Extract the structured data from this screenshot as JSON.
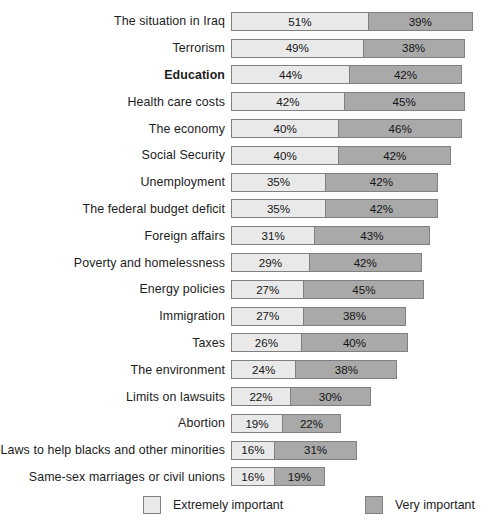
{
  "chart_data": {
    "type": "bar",
    "subtype": "stacked-horizontal",
    "title": "",
    "xlabel": "",
    "ylabel": "",
    "xlim": [
      0,
      90
    ],
    "grid": false,
    "legend_position": "bottom",
    "value_suffix": "%",
    "px_per_percent": 2.685,
    "categories": [
      "The situation in Iraq",
      "Terrorism",
      "Education",
      "Health care costs",
      "The economy",
      "Social Security",
      "Unemployment",
      "The federal budget deficit",
      "Foreign affairs",
      "Poverty and homelessness",
      "Energy policies",
      "Immigration",
      "Taxes",
      "The environment",
      "Limits on lawsuits",
      "Abortion",
      "Laws to help blacks and other minorities",
      "Same-sex marriages or civil unions"
    ],
    "highlight_category": "Education",
    "series": [
      {
        "name": "Extremely important",
        "color": "#e9e9e9",
        "values": [
          51,
          49,
          44,
          42,
          40,
          40,
          35,
          35,
          31,
          29,
          27,
          27,
          26,
          24,
          22,
          19,
          16,
          16
        ]
      },
      {
        "name": "Very important",
        "color": "#a9a9a9",
        "values": [
          39,
          38,
          42,
          45,
          46,
          42,
          42,
          42,
          43,
          42,
          45,
          38,
          40,
          38,
          30,
          22,
          31,
          19
        ]
      }
    ],
    "rows": [
      {
        "label": "The situation in Iraq",
        "extremely": "51%",
        "very": "39%",
        "extremely_value": 51,
        "very_value": 39,
        "bold": false
      },
      {
        "label": "Terrorism",
        "extremely": "49%",
        "very": "38%",
        "extremely_value": 49,
        "very_value": 38,
        "bold": false
      },
      {
        "label": "Education",
        "extremely": "44%",
        "very": "42%",
        "extremely_value": 44,
        "very_value": 42,
        "bold": true
      },
      {
        "label": "Health care costs",
        "extremely": "42%",
        "very": "45%",
        "extremely_value": 42,
        "very_value": 45,
        "bold": false
      },
      {
        "label": "The economy",
        "extremely": "40%",
        "very": "46%",
        "extremely_value": 40,
        "very_value": 46,
        "bold": false
      },
      {
        "label": "Social Security",
        "extremely": "40%",
        "very": "42%",
        "extremely_value": 40,
        "very_value": 42,
        "bold": false
      },
      {
        "label": "Unemployment",
        "extremely": "35%",
        "very": "42%",
        "extremely_value": 35,
        "very_value": 42,
        "bold": false
      },
      {
        "label": "The federal budget deficit",
        "extremely": "35%",
        "very": "42%",
        "extremely_value": 35,
        "very_value": 42,
        "bold": false
      },
      {
        "label": "Foreign affairs",
        "extremely": "31%",
        "very": "43%",
        "extremely_value": 31,
        "very_value": 43,
        "bold": false
      },
      {
        "label": "Poverty and homelessness",
        "extremely": "29%",
        "very": "42%",
        "extremely_value": 29,
        "very_value": 42,
        "bold": false
      },
      {
        "label": "Energy policies",
        "extremely": "27%",
        "very": "45%",
        "extremely_value": 27,
        "very_value": 45,
        "bold": false
      },
      {
        "label": "Immigration",
        "extremely": "27%",
        "very": "38%",
        "extremely_value": 27,
        "very_value": 38,
        "bold": false
      },
      {
        "label": "Taxes",
        "extremely": "26%",
        "very": "40%",
        "extremely_value": 26,
        "very_value": 40,
        "bold": false
      },
      {
        "label": "The environment",
        "extremely": "24%",
        "very": "38%",
        "extremely_value": 24,
        "very_value": 38,
        "bold": false
      },
      {
        "label": "Limits on lawsuits",
        "extremely": "22%",
        "very": "30%",
        "extremely_value": 22,
        "very_value": 30,
        "bold": false
      },
      {
        "label": "Abortion",
        "extremely": "19%",
        "very": "22%",
        "extremely_value": 19,
        "very_value": 22,
        "bold": false
      },
      {
        "label": "Laws to help blacks and other minorities",
        "extremely": "16%",
        "very": "31%",
        "extremely_value": 16,
        "very_value": 31,
        "bold": false
      },
      {
        "label": "Same-sex marriages or civil unions",
        "extremely": "16%",
        "very": "19%",
        "extremely_value": 16,
        "very_value": 19,
        "bold": false
      }
    ],
    "legend": [
      {
        "label": "Extremely important",
        "color": "#e9e9e9"
      },
      {
        "label": "Very important",
        "color": "#a9a9a9"
      }
    ]
  }
}
